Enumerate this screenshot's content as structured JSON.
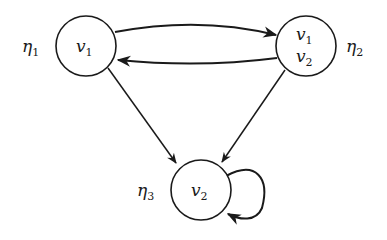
{
  "diagram": {
    "type": "directed-graph",
    "nodes": [
      {
        "id": "eta1",
        "name": "η",
        "name_sub": "1",
        "contents": [
          {
            "var": "v",
            "sub": "1"
          }
        ]
      },
      {
        "id": "eta2",
        "name": "η",
        "name_sub": "2",
        "contents": [
          {
            "var": "v",
            "sub": "1"
          },
          {
            "var": "v",
            "sub": "2"
          }
        ]
      },
      {
        "id": "eta3",
        "name": "η",
        "name_sub": "3",
        "contents": [
          {
            "var": "v",
            "sub": "2"
          }
        ]
      }
    ],
    "edges": [
      {
        "from": "eta1",
        "to": "eta2"
      },
      {
        "from": "eta2",
        "to": "eta1"
      },
      {
        "from": "eta1",
        "to": "eta3"
      },
      {
        "from": "eta2",
        "to": "eta3"
      },
      {
        "from": "eta3",
        "to": "eta3"
      }
    ],
    "colors": {
      "stroke": "#1a1a1a",
      "background": "#ffffff"
    }
  }
}
